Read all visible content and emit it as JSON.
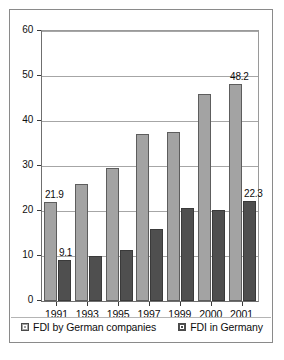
{
  "chart_data": {
    "type": "bar",
    "title": "",
    "xlabel": "",
    "ylabel": "",
    "categories": [
      "1991",
      "1993",
      "1995",
      "1997",
      "1999",
      "2000",
      "2001"
    ],
    "series": [
      {
        "name": "FDI by German companies",
        "color": "#a3a3a3",
        "values": [
          21.9,
          26.1,
          29.5,
          37.0,
          37.5,
          46.1,
          48.2
        ],
        "labels": [
          "21.9",
          "",
          "",
          "",
          "",
          "",
          "48.2"
        ]
      },
      {
        "name": "FDI in Germany",
        "color": "#4f4f4f",
        "values": [
          9.1,
          10.0,
          11.3,
          15.9,
          20.6,
          20.2,
          22.3
        ],
        "labels": [
          "9.1",
          "",
          "",
          "",
          "",
          "",
          "22.3"
        ]
      }
    ],
    "ylim": [
      0,
      60
    ],
    "yticks": [
      "0",
      "10",
      "20",
      "30",
      "40",
      "50",
      "60"
    ],
    "grid": true,
    "legend_position": "bottom"
  },
  "legend": {
    "entries": [
      {
        "label": "FDI by German companies"
      },
      {
        "label": "FDI in Germany"
      }
    ]
  },
  "colors": {
    "series_light": "#a3a3a3",
    "series_dark": "#4f4f4f",
    "gridline": "#a6a6a6",
    "frame": "#8a8a8a"
  }
}
